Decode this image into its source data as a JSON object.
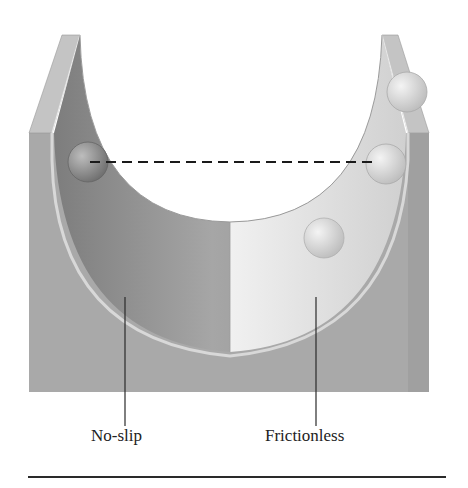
{
  "figure": {
    "labels": {
      "left": "No-slip",
      "right": "Frictionless"
    },
    "colors": {
      "block": "#a9a9a9",
      "post_top": "#c8c8c8",
      "noslip_surface": "#8e8e8e",
      "frictionless_surface": "#eeeeee",
      "dashed_line": "#1a1a1a",
      "rule": "#2a2a2a"
    },
    "balls": [
      {
        "name": "noslip-ball-start",
        "cx": 88,
        "cy": 162,
        "r": 20
      },
      {
        "name": "frictionless-ball-high",
        "cx": 407,
        "cy": 92,
        "r": 20
      },
      {
        "name": "frictionless-ball-level",
        "cx": 386,
        "cy": 164,
        "r": 20
      },
      {
        "name": "frictionless-ball-mid",
        "cx": 324,
        "cy": 238,
        "r": 20
      }
    ],
    "dashed_line": {
      "x1": 90,
      "y1": 162,
      "x2": 372,
      "y2": 162
    }
  }
}
